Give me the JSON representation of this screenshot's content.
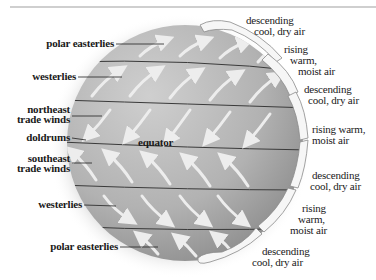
{
  "diagram": {
    "left_labels": [
      {
        "id": "polar-easterlies-north",
        "text": "polar easterlies"
      },
      {
        "id": "westerlies-north",
        "text": "westerlies"
      },
      {
        "id": "northeast-trade-winds-1",
        "text": "northeast"
      },
      {
        "id": "northeast-trade-winds-2",
        "text": "trade winds"
      },
      {
        "id": "doldrums",
        "text": "doldrums"
      },
      {
        "id": "southeast-trade-winds-1",
        "text": "southeast"
      },
      {
        "id": "southeast-trade-winds-2",
        "text": "trade winds"
      },
      {
        "id": "westerlies-south",
        "text": "westerlies"
      },
      {
        "id": "polar-easterlies-south",
        "text": "polar easterlies"
      }
    ],
    "center_label": "equator",
    "right_labels": [
      {
        "lines": [
          "descending",
          "cool, dry air"
        ]
      },
      {
        "lines": [
          "rising",
          "warm,",
          "moist air"
        ]
      },
      {
        "lines": [
          "descending",
          "cool, dry air"
        ]
      },
      {
        "lines": [
          "rising warm,",
          "moist air"
        ]
      },
      {
        "lines": [
          "descending",
          "cool, dry air"
        ]
      },
      {
        "lines": [
          "rising",
          "warm,",
          "moist air"
        ]
      },
      {
        "lines": [
          "descending",
          "cool, dry air"
        ]
      }
    ],
    "colors": {
      "globe_light": "#c9c9c9",
      "globe_dark": "#8e8e8e",
      "arrow": "#ededed",
      "belt_line": "#3a3a3a",
      "cell_fill": "#f6f6f6",
      "cell_stroke": "#8a8a8a",
      "text": "#1a1a1a"
    }
  }
}
